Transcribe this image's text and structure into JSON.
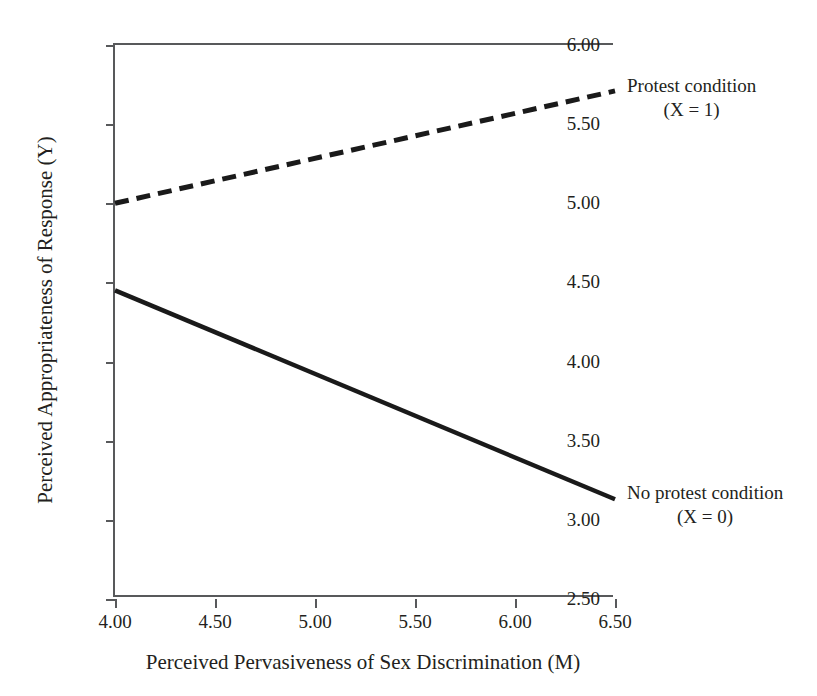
{
  "chart_data": {
    "type": "line",
    "title": "",
    "xlabel": "Perceived Pervasiveness of Sex Discrimination (M)",
    "ylabel": "Perceived Appropriateness of Response (Y)",
    "xlim": [
      4.0,
      6.5
    ],
    "ylim": [
      2.5,
      6.0
    ],
    "xticks": [
      "4.00",
      "4.50",
      "5.00",
      "5.50",
      "6.00",
      "6.50"
    ],
    "xtick_values": [
      4.0,
      4.5,
      5.0,
      5.5,
      6.0,
      6.5
    ],
    "yticks": [
      "2.50",
      "3.00",
      "3.50",
      "4.00",
      "4.50",
      "5.00",
      "5.50",
      "6.00"
    ],
    "ytick_values": [
      2.5,
      3.0,
      3.5,
      4.0,
      4.5,
      5.0,
      5.5,
      6.0
    ],
    "grid": false,
    "legend_position": "right-inline-annotations",
    "series": [
      {
        "name": "Protest condition (X = 1)",
        "style": "dashed",
        "color": "#1a1a1a",
        "x": [
          4.0,
          6.5
        ],
        "values": [
          5.0,
          5.71
        ]
      },
      {
        "name": "No protest condition (X = 0)",
        "style": "solid",
        "color": "#1a1a1a",
        "x": [
          4.0,
          6.5
        ],
        "values": [
          4.45,
          3.13
        ]
      }
    ],
    "annotations": [
      {
        "line1": "Protest condition",
        "line2": "(X = 1)"
      },
      {
        "line1": "No protest condition",
        "line2": "(X = 0)"
      }
    ]
  },
  "axes": {
    "x_title": "Perceived Pervasiveness of Sex Discrimination (M)",
    "y_title": "Perceived Appropriateness of Response (Y)",
    "x_labels": [
      "4.00",
      "4.50",
      "5.00",
      "5.50",
      "6.00",
      "6.50"
    ],
    "y_labels": [
      "6.00",
      "5.50",
      "5.00",
      "4.50",
      "4.00",
      "3.50",
      "3.00",
      "2.50"
    ]
  },
  "annotations": {
    "protest_line1": "Protest condition",
    "protest_line2": "(X = 1)",
    "noprotest_line1": "No protest condition",
    "noprotest_line2": "(X = 0)"
  },
  "colors": {
    "axis": "#58595b",
    "line": "#1a1a1a",
    "text": "#231f20",
    "background": "#ffffff"
  }
}
